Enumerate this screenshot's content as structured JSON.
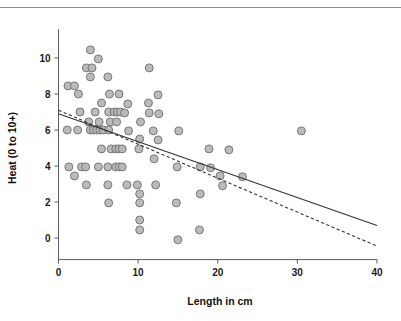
{
  "chart_data": {
    "type": "scatter",
    "title": "",
    "xlabel": "Length in cm",
    "ylabel": "Heat (0 to 10+)",
    "xlim": [
      0,
      40
    ],
    "ylim": [
      -1.2,
      11.6
    ],
    "xticks": [
      0,
      10,
      20,
      30,
      40
    ],
    "xtick_labels": [
      "0",
      "10",
      "20",
      "30",
      "40"
    ],
    "yticks": [
      0,
      2,
      4,
      6,
      8,
      10
    ],
    "ytick_labels": [
      "0",
      "2",
      "4",
      "6",
      "8",
      "10"
    ],
    "grid": false,
    "legend": "none",
    "marker": {
      "shape": "circle",
      "fill_color": "#b7b7b7",
      "edge_color": "#6e6e6e",
      "size_px": 5.2
    },
    "points": [
      [
        1.2,
        8.45
      ],
      [
        2.0,
        8.45
      ],
      [
        2.5,
        8.0
      ],
      [
        4.0,
        10.45
      ],
      [
        5.0,
        9.95
      ],
      [
        3.5,
        9.45
      ],
      [
        4.2,
        9.45
      ],
      [
        4.0,
        8.95
      ],
      [
        6.2,
        8.95
      ],
      [
        11.4,
        9.45
      ],
      [
        6.4,
        8.0
      ],
      [
        7.6,
        8.0
      ],
      [
        12.5,
        7.95
      ],
      [
        5.4,
        7.5
      ],
      [
        8.7,
        7.45
      ],
      [
        11.3,
        7.5
      ],
      [
        2.7,
        7.0
      ],
      [
        4.6,
        7.0
      ],
      [
        6.3,
        7.0
      ],
      [
        7.0,
        7.0
      ],
      [
        7.4,
        7.0
      ],
      [
        7.8,
        7.0
      ],
      [
        8.3,
        6.95
      ],
      [
        11.4,
        6.95
      ],
      [
        12.6,
        6.9
      ],
      [
        3.8,
        6.45
      ],
      [
        5.1,
        6.45
      ],
      [
        6.5,
        6.45
      ],
      [
        7.3,
        6.45
      ],
      [
        10.3,
        6.45
      ],
      [
        1.1,
        6.0
      ],
      [
        2.4,
        6.0
      ],
      [
        4.0,
        6.0
      ],
      [
        4.4,
        6.0
      ],
      [
        4.8,
        6.0
      ],
      [
        5.2,
        6.0
      ],
      [
        5.6,
        6.0
      ],
      [
        6.3,
        6.0
      ],
      [
        8.8,
        5.95
      ],
      [
        11.9,
        5.95
      ],
      [
        15.1,
        5.95
      ],
      [
        30.5,
        5.95
      ],
      [
        10.2,
        5.5
      ],
      [
        12.5,
        5.45
      ],
      [
        5.4,
        4.95
      ],
      [
        6.6,
        4.95
      ],
      [
        7.2,
        4.95
      ],
      [
        7.6,
        4.95
      ],
      [
        8.0,
        4.95
      ],
      [
        10.1,
        4.95
      ],
      [
        18.9,
        4.95
      ],
      [
        21.4,
        4.9
      ],
      [
        12.0,
        4.4
      ],
      [
        1.3,
        3.95
      ],
      [
        2.9,
        3.95
      ],
      [
        3.4,
        3.95
      ],
      [
        5.0,
        3.95
      ],
      [
        6.2,
        3.95
      ],
      [
        7.2,
        3.95
      ],
      [
        7.6,
        3.95
      ],
      [
        8.0,
        3.95
      ],
      [
        14.9,
        3.95
      ],
      [
        17.8,
        3.95
      ],
      [
        19.1,
        3.9
      ],
      [
        2.0,
        3.45
      ],
      [
        20.3,
        3.45
      ],
      [
        23.1,
        3.4
      ],
      [
        3.5,
        2.95
      ],
      [
        6.2,
        2.95
      ],
      [
        8.6,
        2.95
      ],
      [
        9.9,
        2.95
      ],
      [
        12.2,
        2.95
      ],
      [
        20.6,
        2.9
      ],
      [
        17.8,
        2.45
      ],
      [
        10.2,
        2.45
      ],
      [
        6.3,
        1.95
      ],
      [
        10.2,
        1.95
      ],
      [
        14.8,
        1.95
      ],
      [
        10.2,
        1.0
      ],
      [
        17.7,
        0.45
      ],
      [
        10.2,
        0.45
      ],
      [
        15.0,
        -0.1
      ]
    ],
    "fit_lines": [
      {
        "name": "solid-regression-line",
        "style": "solid",
        "color": "#333333",
        "x_start": 0,
        "y_start": 6.9,
        "x_end": 40,
        "y_end": 0.7
      },
      {
        "name": "dashed-regression-line",
        "style": "dashed",
        "color": "#333333",
        "x_start": 0,
        "y_start": 7.1,
        "x_end": 40,
        "y_end": -0.45
      }
    ]
  }
}
